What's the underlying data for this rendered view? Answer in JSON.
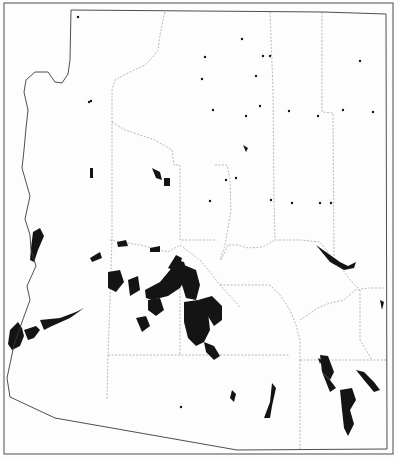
{
  "map": {
    "title": "",
    "colors": {
      "background": "#fdfdfd",
      "frame": "#6a6a6a",
      "state_border": "#3a3a3a",
      "county_border": "#8a8a8a",
      "shaded_area": "#141414"
    },
    "frame": {
      "x": 4,
      "y": 3,
      "width": 389,
      "height": 451
    },
    "state_outline": "M71,10 L323,12 L386,14 L387,449 L237,450 L55,418 L10,397 L7,378 L14,345 L22,322 L30,300 L27,286 L36,266 L31,250 L30,235 L25,219 L30,196 L22,168 L24,150 L26,128 L28,110 L24,92 L26,80 L35,72 L48,72 L55,82 L62,83 L68,74 L70,60 L71,10 Z",
    "county_lines": [
      "M165,12 L163,20 L160,35 L158,50 L152,58 L145,65 L130,72 L115,80 L112,90 L112,130 L112,180 L112,240 L110,300 L108,355 L107,400",
      "M112,122 L125,130 L140,135 L155,140 L165,146 L172,150 L174,165 L180,165 L180,240 L215,240",
      "M270,12 L273,90 L274,200 L275,240",
      "M322,12 L322,112 L333,113 L334,260",
      "M215,165 L227,165 L230,180 L231,210 L228,228 L225,245 L220,260",
      "M221,260 L228,245 L238,245 L248,248 L263,247 L275,240 L300,240 L320,242 L334,260",
      "M110,240 L140,245 L168,252 L180,245 L200,260 L210,272 L220,285 L230,296 L240,307",
      "M180,282 L180,355",
      "M108,355 L180,355 L290,355",
      "M220,285 L270,285 L280,295 L290,310 L296,325 L300,340 L300,360",
      "M300,320 L318,308 L330,303 L344,300 L355,290 L368,288 L384,288",
      "M300,360 L300,450",
      "M300,360 L386,360",
      "M360,290 L360,340 L372,360",
      "M334,260 L343,270 L350,280 L358,288"
    ],
    "shaded_patches": [
      "M10,330 L18,322 L22,328 L24,336 L20,346 L12,350 L8,344 Z",
      "M24,330 L36,326 L40,330 L34,338 L28,340 Z",
      "M40,320 L60,318 L76,312 L84,308 L70,318 L52,326 L44,330 Z",
      "M33,232 L40,228 L44,236 L38,250 L34,262 L30,260 L31,248 Z",
      "M108,272 L120,270 L124,282 L116,292 L108,288 Z",
      "M128,280 L138,276 L140,290 L130,296 Z",
      "M145,290 L160,282 L170,270 L176,260 L184,262 L188,275 L180,288 L168,296 L152,300 L146,298 Z",
      "M168,268 L176,255 L182,258 L178,272 Z",
      "M184,265 L196,270 L200,285 L196,300 L186,298 L182,285 Z",
      "M184,302 L198,300 L208,312 L210,330 L204,342 L196,346 L188,338 L184,322 Z",
      "M198,300 L212,296 L222,306 L222,320 L214,326 Z",
      "M148,300 L160,298 L164,310 L156,316 L148,310 Z",
      "M136,318 L146,316 L150,326 L142,332 Z",
      "M204,342 L214,346 L220,356 L214,360 L206,352 Z",
      "M150,248 L160,246 L160,252 L150,252 Z",
      "M117,242 L126,240 L128,246 L118,247 Z",
      "M90,258 L100,252 L102,258 L92,262 Z",
      "M316,245 L340,262 L348,266 L356,262 L354,268 L344,270 L330,262 Z",
      "M320,355 L328,356 L334,372 L330,380 L322,372 Z",
      "M340,390 L352,388 L356,400 L350,410 L354,424 L348,436 L344,428 L342,410 Z",
      "M356,370 L364,372 L374,382 L380,390 L374,392 L364,380 Z",
      "M272,383 L276,388 L272,406 L270,418 L264,418 L270,402 Z",
      "M232,390 L236,394 L234,402 L230,398 Z",
      "M322,372 L330,380 L336,388 L330,392 Z",
      "M152,168 L160,172 L162,180 L156,178 Z",
      "M164,178 L170,178 L170,186 L164,186 Z",
      "M90,168 L93,168 L93,178 L90,178 Z",
      "M243,145 L248,148 L246,152 Z",
      "M318,358 L322,360 L320,364 Z",
      "M380,300 L384,302 L382,310 Z"
    ],
    "specks": [
      [
        78,
        17
      ],
      [
        91,
        101
      ],
      [
        89,
        102
      ],
      [
        263,
        56
      ],
      [
        270,
        56
      ],
      [
        242,
        39
      ],
      [
        256,
        76
      ],
      [
        202,
        79
      ],
      [
        271,
        200
      ],
      [
        292,
        203
      ],
      [
        318,
        116
      ],
      [
        343,
        110
      ],
      [
        331,
        203
      ],
      [
        236,
        178
      ],
      [
        226,
        180
      ],
      [
        289,
        111
      ],
      [
        260,
        106
      ],
      [
        320,
        203
      ],
      [
        181,
        407
      ],
      [
        373,
        112
      ],
      [
        360,
        61
      ],
      [
        210,
        201
      ],
      [
        205,
        57
      ],
      [
        213,
        110
      ],
      [
        246,
        116
      ]
    ]
  }
}
